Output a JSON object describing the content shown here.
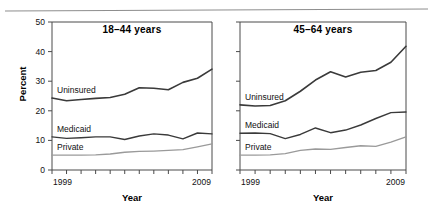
{
  "figure": {
    "top_rule": true,
    "xlabel": "Year",
    "ylabel": "Percent"
  },
  "chart_data": {
    "type": "line",
    "title": "",
    "xlabel": "Year",
    "ylabel": "Percent",
    "xlim": [
      1999,
      2009
    ],
    "ylim": [
      0,
      50
    ],
    "yticks": [
      0,
      10,
      20,
      30,
      40,
      50
    ],
    "ytick_labels": [
      "0",
      "10",
      "20",
      "30",
      "40",
      "50"
    ],
    "x": [
      1999,
      2000,
      2001,
      2002,
      2003,
      2004,
      2005,
      2006,
      2007,
      2008,
      2009
    ],
    "xtick_labels_shown": [
      "1999",
      "2009"
    ],
    "grid": false,
    "legend": "inline-labels",
    "panels": [
      {
        "id": "panel-18-44",
        "title": "18–44 years",
        "ytick_labels_visible": true,
        "series": [
          {
            "name": "Uninsured",
            "label": "Uninsured",
            "color": "#3a3a3a",
            "width": 1.6,
            "values": [
              24.3,
              23.4,
              23.8,
              24.2,
              24.5,
              25.6,
              27.8,
              27.6,
              27.1,
              29.6,
              31.0,
              34.1
            ]
          },
          {
            "name": "Medicaid",
            "label": "Medicaid",
            "color": "#3a3a3a",
            "width": 1.4,
            "values": [
              11.2,
              10.7,
              10.9,
              11.2,
              11.2,
              10.3,
              11.5,
              12.2,
              11.8,
              10.5,
              12.5,
              12.2
            ]
          },
          {
            "name": "Private",
            "label": "Private",
            "color": "#9a9a9a",
            "width": 1.3,
            "values": [
              5.0,
              5.0,
              5.0,
              5.1,
              5.4,
              6.0,
              6.3,
              6.4,
              6.6,
              6.9,
              7.8,
              8.8
            ]
          }
        ]
      },
      {
        "id": "panel-45-64",
        "title": "45–64 years",
        "ytick_labels_visible": false,
        "series": [
          {
            "name": "Uninsured",
            "label": "Uninsured",
            "color": "#3a3a3a",
            "width": 1.6,
            "values": [
              22.0,
              21.6,
              21.8,
              23.4,
              26.6,
              30.4,
              33.2,
              31.4,
              33.0,
              33.6,
              36.4,
              41.8
            ]
          },
          {
            "name": "Medicaid",
            "label": "Medicaid",
            "color": "#3a3a3a",
            "width": 1.4,
            "values": [
              12.4,
              12.5,
              12.3,
              10.6,
              12.0,
              14.2,
              12.6,
              13.5,
              15.2,
              17.4,
              19.4,
              19.6
            ]
          },
          {
            "name": "Private",
            "label": "Private",
            "color": "#9a9a9a",
            "width": 1.3,
            "values": [
              5.0,
              5.0,
              5.1,
              5.5,
              6.6,
              7.1,
              7.0,
              7.6,
              8.2,
              8.0,
              9.4,
              11.2
            ]
          }
        ]
      }
    ]
  }
}
